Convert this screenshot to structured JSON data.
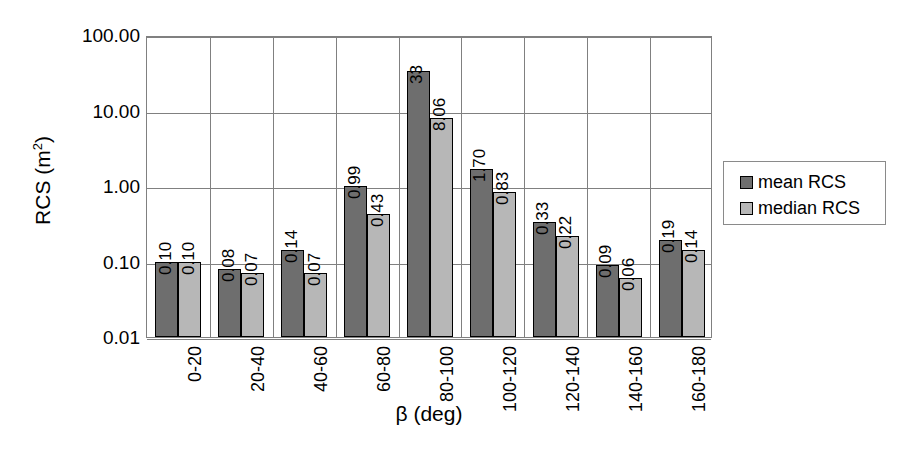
{
  "chart_data": {
    "type": "bar",
    "title": "",
    "xlabel": "β (deg)",
    "ylabel": "RCS (m²)",
    "ylabel_base": "RCS (m",
    "ylabel_sup": "2",
    "ylabel_close": ")",
    "yscale": "log",
    "ylim": [
      0.01,
      100
    ],
    "ytick_labels": [
      "100.00",
      "10.00",
      "1.00",
      "0.10",
      "0.01"
    ],
    "ytick_values": [
      100,
      10,
      1,
      0.1,
      0.01
    ],
    "grid": "horizontal-and-category-separators",
    "legend_position": "right",
    "categories": [
      "0-20",
      "20-40",
      "40-60",
      "60-80",
      "80-100",
      "100-120",
      "120-140",
      "140-160",
      "160-180"
    ],
    "series": [
      {
        "name": "mean RCS",
        "color": "#6e6e6e",
        "values": [
          0.1,
          0.08,
          0.14,
          0.99,
          33,
          1.7,
          0.33,
          0.09,
          0.19
        ],
        "labels": [
          "0.10",
          "0.08",
          "0.14",
          "0.99",
          "33",
          "1.70",
          "0.33",
          "0.09",
          "0.19"
        ]
      },
      {
        "name": "median RCS",
        "color": "#b7b7b7",
        "values": [
          0.1,
          0.07,
          0.07,
          0.43,
          8.06,
          0.83,
          0.22,
          0.06,
          0.14
        ],
        "labels": [
          "0.10",
          "0.07",
          "0.07",
          "0.43",
          "8.06",
          "0.83",
          "0.22",
          "0.06",
          "0.14"
        ]
      }
    ]
  },
  "legend": {
    "entries": [
      {
        "label": "mean RCS"
      },
      {
        "label": "median RCS"
      }
    ]
  }
}
